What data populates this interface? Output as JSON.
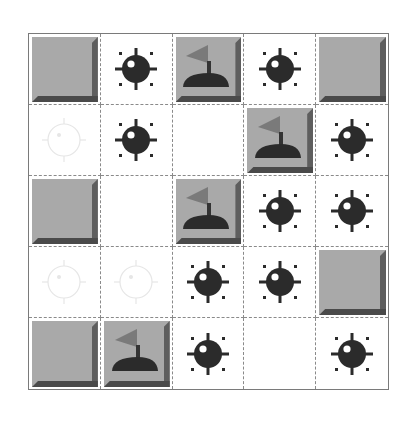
{
  "game": {
    "title": "Minesweeper",
    "rows": 5,
    "cols": 5,
    "colors": {
      "tile": "#a9a9a9",
      "tile_shadow": "#5e5e5e",
      "mine": "#2b2b2b",
      "flag": "#7a7a7a",
      "ghost": "#e6e6e6",
      "grid_line": "#8a8a8a"
    },
    "cells": [
      [
        "raised",
        "mine",
        "flag",
        "mine",
        "raised"
      ],
      [
        "ghost",
        "mine",
        "empty",
        "flag",
        "mine"
      ],
      [
        "raised",
        "empty",
        "flag",
        "mine",
        "mine"
      ],
      [
        "ghost",
        "ghost",
        "mine",
        "mine",
        "raised"
      ],
      [
        "raised",
        "flag",
        "mine",
        "empty",
        "mine"
      ]
    ]
  }
}
